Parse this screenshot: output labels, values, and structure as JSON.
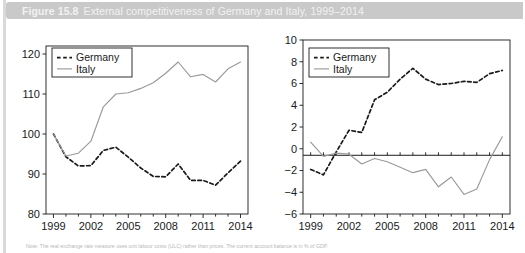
{
  "figure": {
    "number": "Figure 15.8",
    "caption": "External competitiveness of Germany and Italy, 1999–2014",
    "note": "Note: The real exchange rate measure uses unit labour costs (ULC) rather than prices. The current account balance is in % of GDP."
  },
  "series_colors": {
    "germany": "#1a1a1a",
    "italy": "#9a9a9a",
    "axis": "#1a1a1a",
    "title_bar": "#c9c9c9",
    "title_text": "#f2f2f2"
  },
  "legend": {
    "germany_label": "Germany",
    "italy_label": "Italy"
  },
  "chart_data": [
    {
      "id": "left",
      "type": "line",
      "title": "",
      "xlabel": "",
      "ylabel": "",
      "xlim": [
        1998.4,
        2014.6
      ],
      "ylim": [
        80,
        122
      ],
      "yticks": [
        80,
        90,
        100,
        110,
        120
      ],
      "xticks": [
        1999,
        2002,
        2005,
        2008,
        2011,
        2014
      ],
      "xtick_labels": [
        "1999",
        "2002",
        "2005",
        "2008",
        "2011",
        "2014"
      ],
      "ytick_labels": [
        "80",
        "90",
        "100",
        "110",
        "120"
      ],
      "grid": false,
      "legend_position": "top-left",
      "x": [
        1999,
        2000,
        2001,
        2002,
        2003,
        2004,
        2005,
        2006,
        2007,
        2008,
        2009,
        2010,
        2011,
        2012,
        2013,
        2014
      ],
      "series": [
        {
          "name": "Germany",
          "style": "dashed",
          "values": [
            100.0,
            94.3,
            92.0,
            92.1,
            95.9,
            96.7,
            94.2,
            91.5,
            89.4,
            89.3,
            92.5,
            88.4,
            88.4,
            87.2,
            90.3,
            93.2
          ]
        },
        {
          "name": "Italy",
          "style": "solid",
          "values": [
            100.0,
            94.5,
            95.2,
            98.2,
            106.8,
            110.0,
            110.3,
            111.4,
            112.8,
            115.2,
            118.0,
            114.3,
            114.9,
            113.0,
            116.3,
            118.0
          ]
        }
      ]
    },
    {
      "id": "right",
      "type": "line",
      "title": "",
      "xlabel": "",
      "ylabel": "",
      "xlim": [
        1998.4,
        2014.6
      ],
      "ylim": [
        -6,
        10
      ],
      "yticks": [
        -6,
        -4,
        -2,
        0,
        2,
        4,
        6,
        8,
        10
      ],
      "xticks": [
        1999,
        2002,
        2005,
        2008,
        2011,
        2014
      ],
      "xtick_labels": [
        "1999",
        "2002",
        "2005",
        "2008",
        "2011",
        "2014"
      ],
      "ytick_labels": [
        "−6",
        "−4",
        "−2",
        "0",
        "2",
        "4",
        "6",
        "8",
        "10"
      ],
      "zero_line": -0.6,
      "grid": false,
      "legend_position": "top-left",
      "x": [
        1999,
        2000,
        2001,
        2002,
        2003,
        2004,
        2005,
        2006,
        2007,
        2008,
        2009,
        2010,
        2011,
        2012,
        2013,
        2014
      ],
      "series": [
        {
          "name": "Germany",
          "style": "dashed",
          "values": [
            -1.9,
            -2.4,
            -0.3,
            1.7,
            1.5,
            4.5,
            5.2,
            6.4,
            7.4,
            6.4,
            5.9,
            6.0,
            6.2,
            6.1,
            6.9,
            7.2
          ]
        },
        {
          "name": "Italy",
          "style": "solid",
          "values": [
            0.6,
            -0.7,
            -0.4,
            -0.5,
            -1.4,
            -0.9,
            -1.2,
            -1.7,
            -2.2,
            -1.9,
            -3.5,
            -2.6,
            -4.2,
            -3.7,
            -1.0,
            1.1
          ]
        }
      ]
    }
  ]
}
